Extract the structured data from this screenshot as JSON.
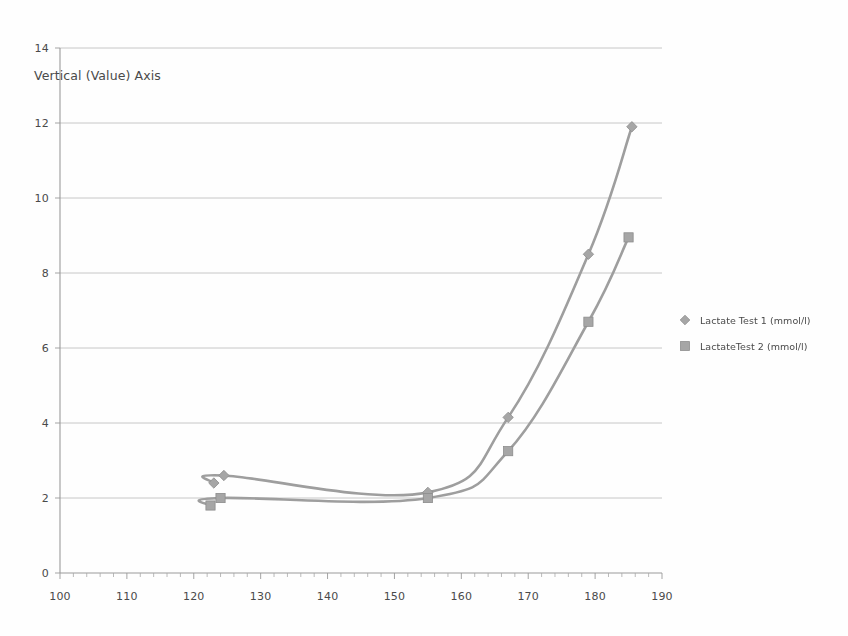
{
  "chart_data": {
    "type": "line",
    "title": "",
    "subtitle": "",
    "xlabel": "",
    "ylabel": "Vertical (Value) Axis",
    "xlim": [
      100,
      190
    ],
    "ylim": [
      0,
      14
    ],
    "x_ticks": [
      100,
      110,
      120,
      130,
      140,
      150,
      160,
      170,
      180,
      190
    ],
    "x_tick_labels": [
      "100",
      "110",
      "120",
      "130",
      "140",
      "150",
      "160",
      "170",
      "180",
      "190"
    ],
    "x_minor_tick_step": 2,
    "y_ticks": [
      0,
      2,
      4,
      6,
      8,
      10,
      12,
      14
    ],
    "y_tick_labels": [
      "0",
      "2",
      "4",
      "6",
      "8",
      "10",
      "12",
      "14"
    ],
    "grid": "horizontal",
    "legend_position": "right",
    "legend": [
      "Lactate Test 1 (mmol/l)",
      "LactateTest  2 (mmol/l)"
    ],
    "series": [
      {
        "name": "Lactate Test 1 (mmol/l)",
        "marker": "diamond",
        "color": "#a6a6a6",
        "points": [
          {
            "x": 123.0,
            "y": 2.4
          },
          {
            "x": 124.5,
            "y": 2.6
          },
          {
            "x": 155.0,
            "y": 2.15
          },
          {
            "x": 167.0,
            "y": 4.15
          },
          {
            "x": 179.0,
            "y": 8.5
          },
          {
            "x": 185.5,
            "y": 11.9
          }
        ]
      },
      {
        "name": "LactateTest  2 (mmol/l)",
        "marker": "square",
        "color": "#a6a6a6",
        "points": [
          {
            "x": 122.5,
            "y": 1.8
          },
          {
            "x": 124.0,
            "y": 2.0
          },
          {
            "x": 155.0,
            "y": 2.0
          },
          {
            "x": 167.0,
            "y": 3.25
          },
          {
            "x": 179.0,
            "y": 6.7
          },
          {
            "x": 185.0,
            "y": 8.95
          }
        ]
      }
    ]
  },
  "axis_title": {
    "vertical": "Vertical (Value) Axis"
  },
  "legend": {
    "items": [
      {
        "label": "Lactate Test 1 (mmol/l)",
        "marker": "diamond"
      },
      {
        "label": "LactateTest  2 (mmol/l)",
        "marker": "square"
      }
    ]
  },
  "colors": {
    "series": "#a6a6a6",
    "gridline": "#b9b9b9",
    "axis": "#9a9a9a",
    "text": "#4a4a4a",
    "background": "#fefefe"
  }
}
